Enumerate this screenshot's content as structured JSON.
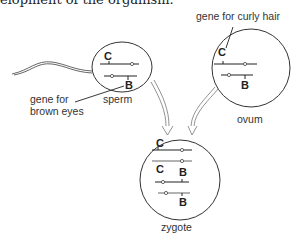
{
  "top_text": "elopment of the organism.",
  "labels": {
    "curly_hair": "gene for curly hair",
    "brown_eyes_line1": "gene for",
    "brown_eyes_line2": "brown eyes",
    "sperm": "sperm",
    "ovum": "ovum",
    "zygote": "zygote"
  },
  "genes": {
    "sperm": [
      "C",
      "B"
    ],
    "ovum": [
      "C",
      "B"
    ],
    "zygote": [
      "C",
      "C",
      "B",
      "B"
    ]
  }
}
